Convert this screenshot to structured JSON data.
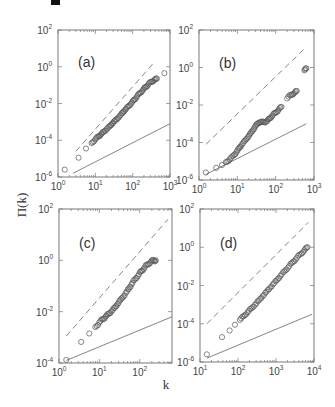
{
  "figure": {
    "ylabel": "Π(k)",
    "xlabel": "k",
    "corner_mark": true
  },
  "chart_data": [
    {
      "type": "scatter",
      "panel": "(a)",
      "frame_px": {
        "x0": 58,
        "x1": 170,
        "y0": 30,
        "y1": 177
      },
      "xscale": "log",
      "yscale": "log",
      "xlim_log10": [
        0,
        3
      ],
      "ylim_log10": [
        -6,
        2
      ],
      "xticks": [
        "10^0",
        "10^1",
        "10^2",
        "10^3"
      ],
      "yticks": [
        "10^-6",
        "10^-4",
        "10^-2",
        "10^0",
        "10^2"
      ],
      "ref_dashed_log10": [
        [
          0.48,
          -4.6
        ],
        [
          2.6,
          0.3
        ]
      ],
      "ref_solid_log10": [
        [
          0.4,
          -5.8
        ],
        [
          3.0,
          -3.1
        ]
      ],
      "points_log10": [
        [
          0.18,
          -5.6
        ],
        [
          0.55,
          -4.95
        ],
        [
          0.75,
          -4.45
        ],
        [
          0.9,
          -4.15
        ],
        [
          1.0,
          -3.95
        ],
        [
          1.08,
          -3.8
        ],
        [
          1.15,
          -3.68
        ],
        [
          1.22,
          -3.55
        ],
        [
          1.3,
          -3.4
        ],
        [
          1.38,
          -3.25
        ],
        [
          1.45,
          -3.1
        ],
        [
          1.52,
          -2.95
        ],
        [
          1.6,
          -2.8
        ],
        [
          1.68,
          -2.62
        ],
        [
          1.75,
          -2.45
        ],
        [
          1.82,
          -2.3
        ],
        [
          1.9,
          -2.12
        ],
        [
          1.98,
          -1.95
        ],
        [
          2.05,
          -1.78
        ],
        [
          2.12,
          -1.6
        ],
        [
          2.2,
          -1.42
        ],
        [
          2.28,
          -1.25
        ],
        [
          2.35,
          -1.1
        ],
        [
          2.42,
          -0.95
        ],
        [
          2.5,
          -0.82
        ],
        [
          2.58,
          -0.72
        ],
        [
          2.65,
          -0.65
        ],
        [
          2.85,
          -0.35
        ]
      ]
    },
    {
      "type": "scatter",
      "panel": "(b)",
      "frame_px": {
        "x0": 199,
        "x1": 314,
        "y0": 30,
        "y1": 180
      },
      "xscale": "log",
      "yscale": "log",
      "xlim_log10": [
        0,
        3
      ],
      "ylim_log10": [
        -6,
        2
      ],
      "xticks": [
        "10^0",
        "10^1",
        "10^2",
        "10^3"
      ],
      "yticks": [
        "10^-6",
        "10^-4",
        "10^-2",
        "10^0",
        "10^2"
      ],
      "ref_dashed_log10": [
        [
          0.18,
          -4.1
        ],
        [
          2.8,
          1.1
        ]
      ],
      "ref_solid_log10": [
        [
          0.18,
          -5.7
        ],
        [
          2.8,
          -3.0
        ]
      ],
      "points_log10": [
        [
          0.18,
          -5.6
        ],
        [
          0.45,
          -5.35
        ],
        [
          0.6,
          -5.2
        ],
        [
          0.7,
          -5.05
        ],
        [
          0.8,
          -4.9
        ],
        [
          0.9,
          -4.7
        ],
        [
          0.98,
          -4.5
        ],
        [
          1.05,
          -4.3
        ],
        [
          1.12,
          -4.1
        ],
        [
          1.2,
          -3.9
        ],
        [
          1.28,
          -3.7
        ],
        [
          1.35,
          -3.5
        ],
        [
          1.42,
          -3.3
        ],
        [
          1.48,
          -3.1
        ],
        [
          1.55,
          -2.95
        ],
        [
          1.62,
          -2.9
        ],
        [
          1.7,
          -2.92
        ],
        [
          1.78,
          -2.85
        ],
        [
          1.85,
          -2.7
        ],
        [
          1.92,
          -2.55
        ],
        [
          2.0,
          -2.4
        ],
        [
          2.08,
          -2.25
        ],
        [
          2.15,
          -2.1
        ],
        [
          2.3,
          -1.65
        ],
        [
          2.4,
          -1.45
        ],
        [
          2.48,
          -1.38
        ],
        [
          2.55,
          -1.25
        ],
        [
          2.75,
          -0.15
        ],
        [
          2.8,
          -0.05
        ]
      ]
    },
    {
      "type": "scatter",
      "panel": "(c)",
      "frame_px": {
        "x0": 59,
        "x1": 172,
        "y0": 209,
        "y1": 363
      },
      "xscale": "log",
      "yscale": "log",
      "xlim_log10": [
        0,
        2.8
      ],
      "ylim_log10": [
        -4,
        2
      ],
      "xticks": [
        "10^0",
        "10^1",
        "10^2"
      ],
      "yticks": [
        "10^-4",
        "10^-2",
        "10^0",
        "10^2"
      ],
      "ref_dashed_log10": [
        [
          0.18,
          -2.95
        ],
        [
          2.7,
          1.6
        ]
      ],
      "ref_solid_log10": [
        [
          0.18,
          -3.9
        ],
        [
          2.8,
          -2.2
        ]
      ],
      "points_log10": [
        [
          0.18,
          -3.88
        ],
        [
          0.55,
          -3.18
        ],
        [
          0.75,
          -2.85
        ],
        [
          0.9,
          -2.6
        ],
        [
          1.0,
          -2.42
        ],
        [
          1.08,
          -2.3
        ],
        [
          1.15,
          -2.2
        ],
        [
          1.22,
          -2.1
        ],
        [
          1.3,
          -1.98
        ],
        [
          1.38,
          -1.85
        ],
        [
          1.45,
          -1.7
        ],
        [
          1.52,
          -1.55
        ],
        [
          1.6,
          -1.4
        ],
        [
          1.68,
          -1.22
        ],
        [
          1.75,
          -1.05
        ],
        [
          1.82,
          -0.88
        ],
        [
          1.9,
          -0.7
        ],
        [
          1.98,
          -0.55
        ],
        [
          2.05,
          -0.4
        ],
        [
          2.12,
          -0.28
        ],
        [
          2.2,
          -0.15
        ],
        [
          2.28,
          -0.05
        ],
        [
          2.35,
          0.0
        ],
        [
          2.4,
          0.0
        ]
      ]
    },
    {
      "type": "scatter",
      "panel": "(d)",
      "frame_px": {
        "x0": 200,
        "x1": 314,
        "y0": 209,
        "y1": 362
      },
      "xscale": "log",
      "yscale": "log",
      "xlim_log10": [
        1,
        4
      ],
      "ylim_log10": [
        -6,
        2
      ],
      "xticks": [
        "10^1",
        "10^2",
        "10^3",
        "10^4"
      ],
      "yticks": [
        "10^-6",
        "10^-4",
        "10^-2",
        "10^0",
        "10^2"
      ],
      "ref_dashed_log10": [
        [
          1.18,
          -4.0
        ],
        [
          3.85,
          1.3
        ]
      ],
      "ref_solid_log10": [
        [
          1.18,
          -5.8
        ],
        [
          3.95,
          -3.5
        ]
      ],
      "points_log10": [
        [
          1.18,
          -5.6
        ],
        [
          1.58,
          -4.7
        ],
        [
          1.78,
          -4.35
        ],
        [
          1.92,
          -4.05
        ],
        [
          2.05,
          -3.8
        ],
        [
          2.15,
          -3.6
        ],
        [
          2.25,
          -3.4
        ],
        [
          2.35,
          -3.2
        ],
        [
          2.45,
          -3.0
        ],
        [
          2.55,
          -2.78
        ],
        [
          2.65,
          -2.55
        ],
        [
          2.75,
          -2.33
        ],
        [
          2.85,
          -2.1
        ],
        [
          2.95,
          -1.88
        ],
        [
          3.05,
          -1.65
        ],
        [
          3.15,
          -1.42
        ],
        [
          3.25,
          -1.2
        ],
        [
          3.35,
          -0.98
        ],
        [
          3.45,
          -0.76
        ],
        [
          3.55,
          -0.55
        ],
        [
          3.65,
          -0.35
        ],
        [
          3.75,
          -0.15
        ],
        [
          3.83,
          0.0
        ]
      ]
    }
  ]
}
